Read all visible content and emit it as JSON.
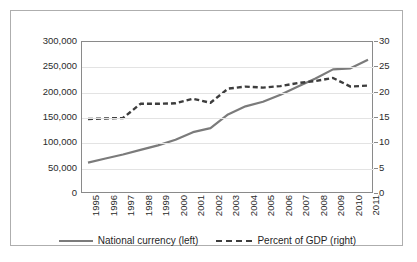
{
  "chart_data": {
    "type": "line",
    "title": "",
    "xlabel": "",
    "ylabel": "",
    "grid": true,
    "legend_position": "bottom",
    "categories": [
      "1995",
      "1996",
      "1997",
      "1998",
      "1999",
      "2000",
      "2001",
      "2002",
      "2003",
      "2004",
      "2005",
      "2006",
      "2007",
      "2008",
      "2009",
      "2010",
      "2011"
    ],
    "axes": {
      "left": {
        "label": "National currency",
        "ticks": [
          "0",
          "50,000",
          "100,000",
          "150,000",
          "200,000",
          "250,000",
          "300,000"
        ],
        "tick_values": [
          0,
          50000,
          100000,
          150000,
          200000,
          250000,
          300000
        ],
        "min": 0,
        "max": 300000
      },
      "right": {
        "label": "Percent of GDP",
        "ticks": [
          "0",
          "5",
          "10",
          "15",
          "20",
          "25",
          "30"
        ],
        "tick_values": [
          0,
          5,
          10,
          15,
          20,
          25,
          30
        ],
        "min": 0,
        "max": 30
      }
    },
    "series": [
      {
        "name": "National currency (left)",
        "axis": "left",
        "style": "solid",
        "color": "#7b7b7b",
        "values": [
          62000,
          70000,
          78000,
          87000,
          96000,
          107000,
          122000,
          130000,
          157000,
          173000,
          182000,
          196000,
          212000,
          228000,
          246000,
          248000,
          265000
        ]
      },
      {
        "name": "Percent of GDP (right)",
        "axis": "right",
        "style": "dashed",
        "color": "#3d3d3d",
        "values": [
          14.8,
          14.9,
          15.0,
          17.8,
          17.8,
          17.9,
          18.8,
          18.0,
          20.8,
          21.2,
          21.0,
          21.3,
          21.9,
          22.3,
          22.9,
          21.2,
          21.4
        ]
      }
    ]
  },
  "legend": {
    "items": [
      {
        "label": "National currency (left)",
        "style": "solid"
      },
      {
        "label": "Percent of GDP (right)",
        "style": "dashed"
      }
    ]
  }
}
